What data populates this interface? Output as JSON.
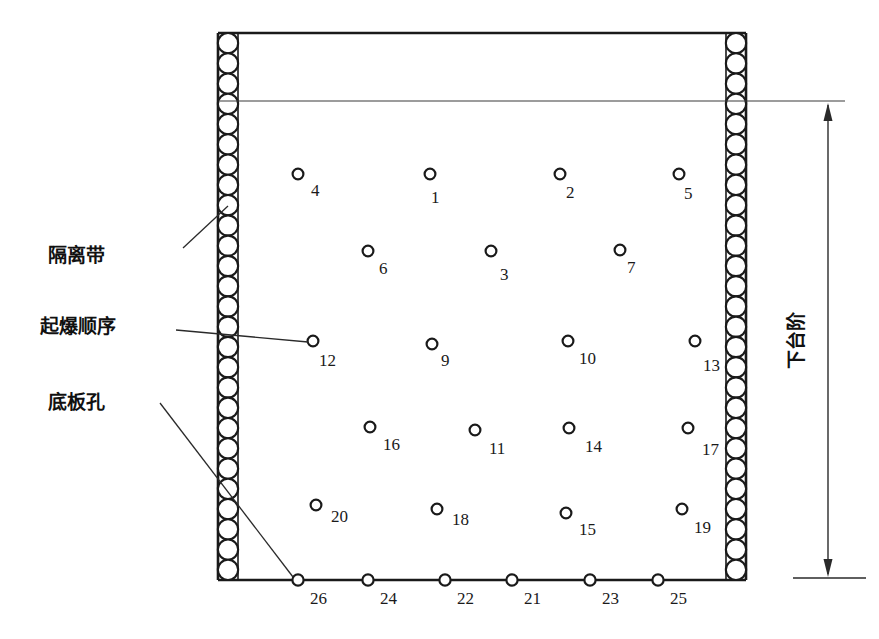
{
  "diagram": {
    "labels": {
      "isolation_band": "隔离带",
      "blast_sequence": "起爆顺序",
      "floor_hole": "底板孔",
      "lower_bench": "下台阶"
    },
    "colors": {
      "line": "#1a1a1a",
      "thin_line": "#3a3a3a",
      "background": "#ffffff",
      "text": "#1a1a1a"
    },
    "frame": {
      "left": 218,
      "right": 746,
      "top": 33,
      "bottom": 580,
      "band_width": 20,
      "band_circle_radius": 10,
      "band_circle_count": 27,
      "surface_line_y": 101,
      "surface_line_x2": 845
    },
    "dimension": {
      "x": 828,
      "y_top": 101,
      "y_bottom": 578,
      "tick_left": 793,
      "tick_right": 866,
      "label": "下台阶"
    },
    "bench_holes": [
      {
        "id": "4",
        "cx": 298,
        "cy": 174,
        "lx": 311,
        "ly": 196
      },
      {
        "id": "1",
        "cx": 430,
        "cy": 174,
        "lx": 431,
        "ly": 203
      },
      {
        "id": "2",
        "cx": 560,
        "cy": 174,
        "lx": 566,
        "ly": 198
      },
      {
        "id": "5",
        "cx": 679,
        "cy": 174,
        "lx": 684,
        "ly": 199
      },
      {
        "id": "6",
        "cx": 368,
        "cy": 251,
        "lx": 379,
        "ly": 274
      },
      {
        "id": "3",
        "cx": 491,
        "cy": 251,
        "lx": 500,
        "ly": 280
      },
      {
        "id": "7",
        "cx": 620,
        "cy": 250,
        "lx": 627,
        "ly": 273
      },
      {
        "id": "12",
        "cx": 313,
        "cy": 341,
        "lx": 319,
        "ly": 366
      },
      {
        "id": "9",
        "cx": 432,
        "cy": 344,
        "lx": 441,
        "ly": 366
      },
      {
        "id": "10",
        "cx": 568,
        "cy": 341,
        "lx": 579,
        "ly": 364
      },
      {
        "id": "13",
        "cx": 695,
        "cy": 341,
        "lx": 703,
        "ly": 371
      },
      {
        "id": "16",
        "cx": 370,
        "cy": 427,
        "lx": 383,
        "ly": 450
      },
      {
        "id": "11",
        "cx": 475,
        "cy": 430,
        "lx": 489,
        "ly": 454
      },
      {
        "id": "14",
        "cx": 569,
        "cy": 428,
        "lx": 585,
        "ly": 452
      },
      {
        "id": "17",
        "cx": 688,
        "cy": 428,
        "lx": 702,
        "ly": 455
      },
      {
        "id": "20",
        "cx": 316,
        "cy": 505,
        "lx": 331,
        "ly": 522
      },
      {
        "id": "18",
        "cx": 437,
        "cy": 509,
        "lx": 452,
        "ly": 525
      },
      {
        "id": "15",
        "cx": 566,
        "cy": 513,
        "lx": 579,
        "ly": 535
      },
      {
        "id": "19",
        "cx": 682,
        "cy": 509,
        "lx": 694,
        "ly": 533
      }
    ],
    "floor_holes": [
      {
        "id": "26",
        "cx": 298,
        "cy": 580,
        "lx": 310,
        "ly": 604
      },
      {
        "id": "24",
        "cx": 368,
        "cy": 580,
        "lx": 380,
        "ly": 604
      },
      {
        "id": "22",
        "cx": 445,
        "cy": 580,
        "lx": 457,
        "ly": 604
      },
      {
        "id": "21",
        "cx": 512,
        "cy": 580,
        "lx": 524,
        "ly": 604
      },
      {
        "id": "23",
        "cx": 590,
        "cy": 580,
        "lx": 602,
        "ly": 604
      },
      {
        "id": "25",
        "cx": 658,
        "cy": 580,
        "lx": 670,
        "ly": 604
      }
    ],
    "annotations": [
      {
        "key": "isolation_band",
        "tx": 48,
        "ty": 262,
        "leader": "183,248 228,206"
      },
      {
        "key": "blast_sequence",
        "tx": 40,
        "ty": 333,
        "leader": "176,330 308,342"
      },
      {
        "key": "floor_hole",
        "tx": 48,
        "ty": 409,
        "leader": "160,403 293,577"
      }
    ]
  }
}
